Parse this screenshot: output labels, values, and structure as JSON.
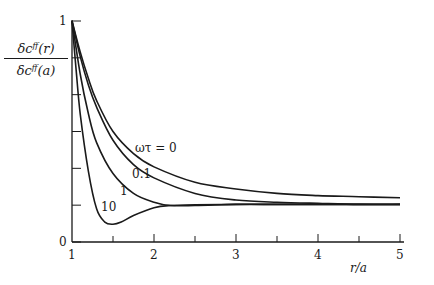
{
  "chart_data": {
    "type": "line",
    "title": "",
    "xlabel": "r/a",
    "ylabel_numerator": "δc^ff(r)",
    "ylabel_denominator": "δc^ff(a)",
    "xlim": [
      1,
      5
    ],
    "ylim": [
      0,
      1
    ],
    "x_ticks": [
      1,
      2,
      3,
      4,
      5
    ],
    "x_minor_ticks": [
      1.5,
      2.5,
      3.5,
      4.5
    ],
    "y_tick_labels": [
      "0",
      "1"
    ],
    "y_ticks": [
      0,
      0.1667,
      0.3333,
      0.5,
      0.6667,
      0.8333,
      1
    ],
    "grid": false,
    "legend": "inline curve labels",
    "series": [
      {
        "name": "ωτ = 0",
        "label": "ωτ = 0",
        "x": [
          1.0,
          1.1,
          1.2,
          1.3,
          1.5,
          1.75,
          2.0,
          2.5,
          3.0,
          3.5,
          4.0,
          4.5,
          5.0
        ],
        "values": [
          1.0,
          0.86,
          0.74,
          0.64,
          0.5,
          0.4,
          0.34,
          0.27,
          0.24,
          0.22,
          0.21,
          0.205,
          0.2
        ]
      },
      {
        "name": "ωτ = 0.1",
        "label": "0.1",
        "x": [
          1.0,
          1.1,
          1.2,
          1.3,
          1.5,
          1.75,
          2.0,
          2.5,
          3.0,
          3.5,
          4.0,
          4.5,
          5.0
        ],
        "values": [
          1.0,
          0.84,
          0.71,
          0.61,
          0.46,
          0.35,
          0.29,
          0.22,
          0.19,
          0.18,
          0.175,
          0.17,
          0.17
        ]
      },
      {
        "name": "ωτ = 1",
        "label": "1",
        "x": [
          1.0,
          1.1,
          1.2,
          1.3,
          1.5,
          1.75,
          2.0,
          2.2,
          2.5,
          3.0,
          3.5,
          4.0,
          5.0
        ],
        "values": [
          1.0,
          0.76,
          0.58,
          0.45,
          0.31,
          0.22,
          0.18,
          0.165,
          0.165,
          0.17,
          0.17,
          0.17,
          0.17
        ]
      },
      {
        "name": "ωτ = 10",
        "label": "10",
        "x": [
          1.0,
          1.05,
          1.1,
          1.2,
          1.3,
          1.4,
          1.5,
          1.6,
          1.75,
          2.0,
          2.2,
          2.5,
          3.0,
          3.5,
          4.0,
          5.0
        ],
        "values": [
          1.0,
          0.78,
          0.58,
          0.32,
          0.15,
          0.09,
          0.08,
          0.09,
          0.12,
          0.155,
          0.165,
          0.168,
          0.17,
          0.17,
          0.17,
          0.17
        ]
      }
    ]
  },
  "axis": {
    "y_zero": "0",
    "y_one": "1",
    "x_labels": [
      "1",
      "2",
      "3",
      "4",
      "5"
    ],
    "xlabel": "r/a"
  },
  "ylabel": {
    "numerator": "δc",
    "numerator_sup": "ff",
    "numerator_arg": "(r)",
    "denominator": "δc",
    "denominator_sup": "ff",
    "denominator_arg": "(a)"
  },
  "curve_labels": {
    "c0": "ωτ = 0",
    "c01": "0.1",
    "c1": "1",
    "c10": "10"
  }
}
